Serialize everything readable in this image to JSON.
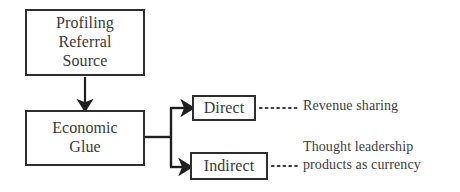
{
  "diagram": {
    "colors": {
      "border": "#2e2e2e",
      "text": "#3a3a3a",
      "connector": "#1f1f1f",
      "background": "#ffffff"
    },
    "nodes": [
      {
        "id": "profiling-referral-source",
        "label": "Profiling\nReferral\nSource"
      },
      {
        "id": "economic-glue",
        "label": "Economic\nGlue"
      },
      {
        "id": "direct",
        "label": "Direct"
      },
      {
        "id": "indirect",
        "label": "Indirect"
      }
    ],
    "annotations": [
      {
        "id": "revenue-sharing",
        "text": "Revenue sharing"
      },
      {
        "id": "thought-leadership",
        "text": "Thought leadership\nproducts as currency"
      }
    ],
    "connectors": [
      {
        "id": "profiling-to-economic-glue",
        "style": "solid-arrow",
        "from": "profiling-referral-source",
        "to": "economic-glue"
      },
      {
        "id": "economic-glue-to-direct",
        "style": "solid-arrow",
        "from": "economic-glue",
        "to": "direct"
      },
      {
        "id": "economic-glue-to-indirect",
        "style": "solid-arrow",
        "from": "economic-glue",
        "to": "indirect"
      },
      {
        "id": "direct-to-revenue-sharing",
        "style": "dotted",
        "from": "direct",
        "to": "revenue-sharing"
      },
      {
        "id": "indirect-to-thought-leadership",
        "style": "dotted",
        "from": "indirect",
        "to": "thought-leadership"
      }
    ]
  }
}
